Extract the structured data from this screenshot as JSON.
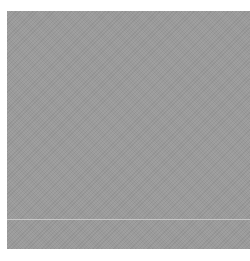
{
  "image": {
    "description": "gray textured square",
    "fill_color": "#9a9a9a",
    "line_color": "#c8c8c8"
  }
}
